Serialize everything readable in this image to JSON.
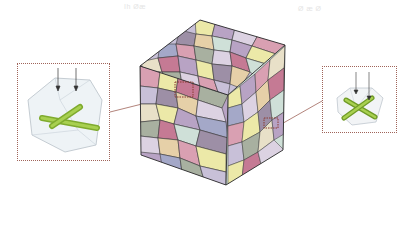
{
  "labels": {
    "left": "Ih Øæ",
    "right": "Ø æ Ø"
  },
  "colors": {
    "grain_palette": [
      "#b8a3c4",
      "#d9a0b2",
      "#ece9a8",
      "#a8b0a0",
      "#c8c0d8",
      "#dcd2e2",
      "#9d8fa6",
      "#e6d0a8",
      "#cfe0d8",
      "#c57a94",
      "#e8e0c8",
      "#a4a8c8"
    ],
    "grain_edge": "#3a3a3a",
    "inset_border": "#a0645a",
    "fiber_green": "#8fbf3a",
    "inset_crystal_edge": "#b8c0c8"
  },
  "cube": {
    "vertices": {
      "top_back": [
        200,
        20
      ],
      "top_left": [
        140,
        66
      ],
      "top_front": [
        228,
        95
      ],
      "top_right": [
        285,
        45
      ],
      "bottom_left": [
        141,
        155
      ],
      "bottom_front": [
        226,
        185
      ],
      "bottom_right": [
        283,
        150
      ]
    }
  },
  "markers": {
    "left_marker": {
      "x": 175,
      "y": 82,
      "w": 18,
      "h": 15
    },
    "right_marker": {
      "x": 264,
      "y": 118,
      "w": 14,
      "h": 10
    }
  },
  "insets": {
    "left": {
      "x": 17,
      "y": 63,
      "w": 93,
      "h": 98
    },
    "right": {
      "x": 322,
      "y": 66,
      "w": 75,
      "h": 67
    }
  }
}
